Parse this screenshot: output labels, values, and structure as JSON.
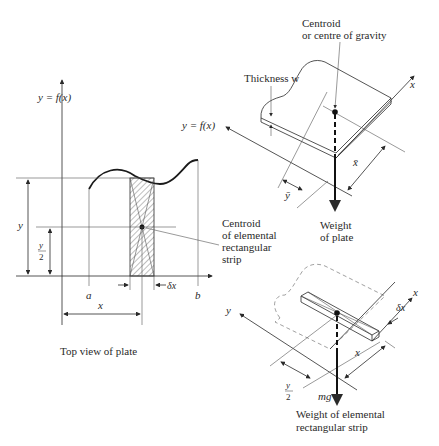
{
  "figure": {
    "left_panel": {
      "axis_label": "y = f(x)",
      "label_y": "y",
      "label_y_half_num": "y",
      "label_y_half_den": "2",
      "label_a": "a",
      "label_b": "b",
      "label_x": "x",
      "label_dx": "δx",
      "caption": "Top view of plate"
    },
    "centroid_strip_callout": {
      "line1": "Centroid",
      "line2": "of elemental",
      "line3": "rectangular",
      "line4": "strip"
    },
    "upper_right_panel": {
      "centroid_line1": "Centroid",
      "centroid_line2": "or centre of gravity",
      "thickness_label": "Thickness w",
      "axis_y_label": "y = f(x)",
      "axis_x_label": "x",
      "xbar_label": "x̄",
      "ybar_label": "ȳ",
      "weight_line1": "Weight",
      "weight_line2": "of plate"
    },
    "lower_right_panel": {
      "axis_y_label": "y",
      "axis_x_label": "x",
      "label_dx": "δx",
      "label_x": "x",
      "label_y_half_num": "y",
      "label_y_half_den": "2",
      "force_label": "mg",
      "caption_line1": "Weight of elemental",
      "caption_line2": "rectangular strip"
    }
  }
}
